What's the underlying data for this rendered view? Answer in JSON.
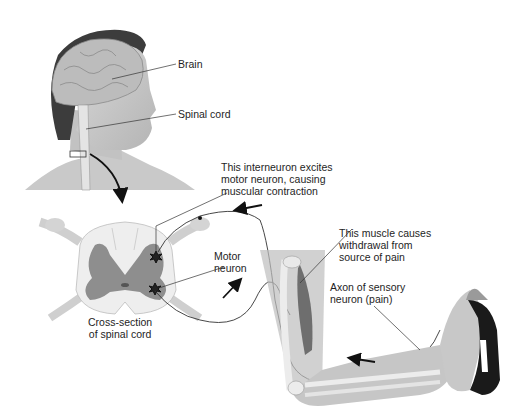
{
  "figure": {
    "labels": {
      "brain": "Brain",
      "spinal_cord": "Spinal cord",
      "interneuron": [
        "This interneuron excites",
        "motor neuron, causing",
        "muscular contraction"
      ],
      "motor_neuron": [
        "Motor",
        "neuron"
      ],
      "muscle": [
        "This muscle causes",
        "withdrawal from",
        "source of pain"
      ],
      "sensory_axon": [
        "Axon of sensory",
        "neuron (pain)"
      ],
      "cross_section": [
        "Cross-section",
        "of spinal cord"
      ]
    },
    "elements": [
      "head-with-brain",
      "spinal-cord",
      "spinal-cord-cross-section",
      "arm-with-muscle",
      "hot-iron",
      "sensory-neuron-path",
      "motor-neuron-path",
      "direction-arrows"
    ],
    "colors": {
      "skin": "#c8c8c8",
      "brain": "#b9b9b9",
      "hair": "#3c3c3c",
      "gray_matter": "#8e8e8e",
      "white_matter": "#eeeeee",
      "muscle": "#6e6e6e",
      "iron": "#1a1a1a",
      "line": "#333333"
    }
  }
}
